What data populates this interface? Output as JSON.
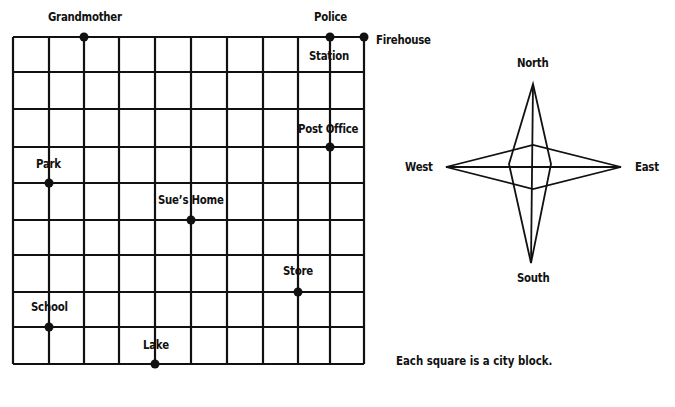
{
  "map": {
    "grid": {
      "columns": 10,
      "rows": 9,
      "x_lines": [
        13,
        49,
        84,
        119,
        155,
        191,
        227,
        263,
        298,
        330,
        364
      ],
      "y_lines": [
        37,
        72,
        109,
        147,
        183,
        220,
        255,
        292,
        327,
        364
      ],
      "line_color": "#111111"
    },
    "places": [
      {
        "name": "Grandmother",
        "label": "Grandmother",
        "col": 2,
        "row": 0
      },
      {
        "name": "Police Station",
        "label_top": "Police",
        "label_bottom": "Station",
        "col": 9,
        "row": 0
      },
      {
        "name": "Firehouse",
        "label": "Firehouse",
        "col": 10,
        "row": 0
      },
      {
        "name": "Post Office",
        "label": "Post Office",
        "col": 9,
        "row": 3
      },
      {
        "name": "Park",
        "label": "Park",
        "col": 1,
        "row": 4
      },
      {
        "name": "Sue's Home",
        "label": "Sue’s Home",
        "col": 5,
        "row": 5
      },
      {
        "name": "Store",
        "label": "Store",
        "col": 8,
        "row": 7
      },
      {
        "name": "School",
        "label": "School",
        "col": 1,
        "row": 8
      },
      {
        "name": "Lake",
        "label": "Lake",
        "col": 4,
        "row": 9
      }
    ],
    "caption": "Each square is a city block."
  },
  "compass": {
    "north": "North",
    "south": "South",
    "east": "East",
    "west": "West"
  }
}
